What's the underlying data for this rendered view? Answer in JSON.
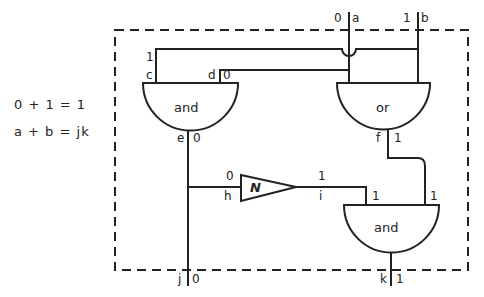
{
  "equations": {
    "numeric": "0 + 1 = 1",
    "symbolic": "a + b = jk"
  },
  "inputs": {
    "a": {
      "label": "a",
      "value": "0"
    },
    "b": {
      "label": "b",
      "value": "1"
    }
  },
  "outputs": {
    "j": {
      "label": "j",
      "value": "0"
    },
    "k": {
      "label": "k",
      "value": "1"
    }
  },
  "gates": {
    "and_top": {
      "label": "and",
      "inputs": [
        {
          "label": "c",
          "value": "1"
        },
        {
          "label": "d",
          "value": "0"
        }
      ],
      "output": {
        "label": "e",
        "value": "0"
      }
    },
    "or_top": {
      "label": "or",
      "output": {
        "label": "f",
        "value": "1"
      }
    },
    "not": {
      "label": "N",
      "input": {
        "label": "h",
        "value": "0"
      },
      "output": {
        "label": "i",
        "value": "1"
      }
    },
    "and_bottom": {
      "label": "and",
      "input_values": [
        "1",
        "1"
      ],
      "output_value": "1"
    }
  }
}
